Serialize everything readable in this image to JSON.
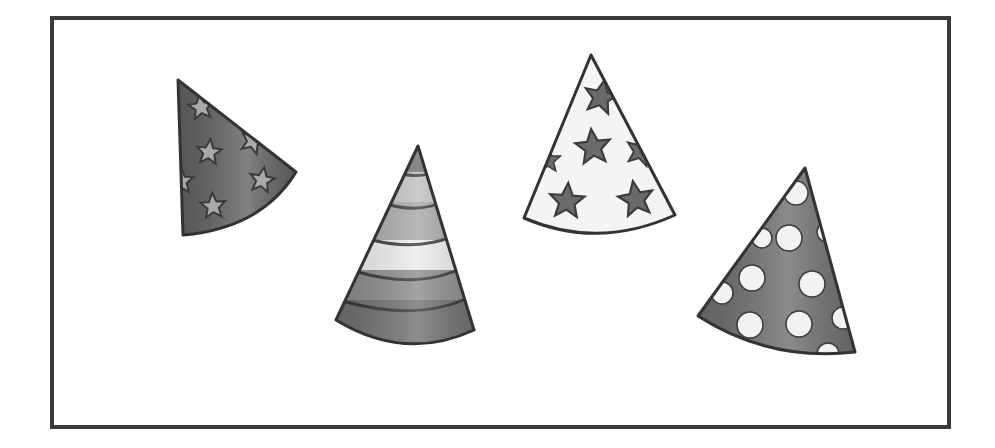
{
  "scene": {
    "description": "Four party hats inside a rectangular frame",
    "count": 4,
    "hats": [
      {
        "name": "dark star hat",
        "pattern": "stars",
        "base_color": "#5e5e5e",
        "pattern_color": "#a9a9a9",
        "orientation": "tilted left"
      },
      {
        "name": "striped hat",
        "pattern": "horizontal stripes",
        "stripe_colors": [
          "#6a6a6a",
          "#bdbdbd",
          "#a5a5a5",
          "#ececec",
          "#8a8a8a",
          "#6e6e6e"
        ],
        "orientation": "upright"
      },
      {
        "name": "white star hat",
        "pattern": "stars",
        "base_color": "#f4f4f4",
        "pattern_color": "#6a6a6a",
        "orientation": "upright"
      },
      {
        "name": "polka dot hat",
        "pattern": "dots",
        "base_color": "#6b6b6b",
        "pattern_color": "#f2f2f2",
        "orientation": "tilted right"
      }
    ]
  },
  "colors": {
    "frame_border": "#3a3a3a",
    "outline": "#333333",
    "background": "#ffffff"
  }
}
